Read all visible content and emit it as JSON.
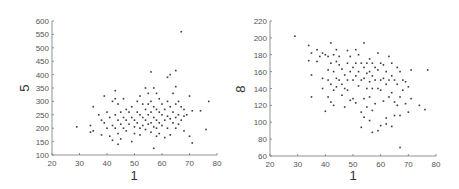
{
  "chart_data": [
    {
      "type": "scatter",
      "title": "",
      "xlabel": "1",
      "ylabel": "5",
      "xlim": [
        20,
        80
      ],
      "ylim": [
        100,
        600
      ],
      "xticks": [
        20,
        30,
        40,
        50,
        60,
        70,
        80
      ],
      "yticks": [
        100,
        150,
        200,
        250,
        300,
        350,
        400,
        450,
        500,
        550,
        600
      ],
      "grid": false,
      "legend": null,
      "points": [
        [
          29,
          205
        ],
        [
          34,
          210
        ],
        [
          34,
          185
        ],
        [
          35,
          280
        ],
        [
          35,
          190
        ],
        [
          37,
          250
        ],
        [
          38,
          230
        ],
        [
          38,
          175
        ],
        [
          39,
          320
        ],
        [
          39,
          220
        ],
        [
          40,
          200
        ],
        [
          40,
          260
        ],
        [
          41,
          170
        ],
        [
          41,
          240
        ],
        [
          42,
          300
        ],
        [
          42,
          210
        ],
        [
          42,
          155
        ],
        [
          43,
          340
        ],
        [
          43,
          310
        ],
        [
          43,
          250
        ],
        [
          43,
          200
        ],
        [
          44,
          290
        ],
        [
          44,
          230
        ],
        [
          44,
          140
        ],
        [
          44,
          180
        ],
        [
          45,
          260
        ],
        [
          45,
          215
        ],
        [
          45,
          160
        ],
        [
          46,
          310
        ],
        [
          46,
          240
        ],
        [
          46,
          200
        ],
        [
          47,
          270
        ],
        [
          47,
          230
        ],
        [
          47,
          190
        ],
        [
          48,
          260
        ],
        [
          48,
          215
        ],
        [
          49,
          280
        ],
        [
          49,
          240
        ],
        [
          49,
          150
        ],
        [
          50,
          230
        ],
        [
          50,
          205
        ],
        [
          50,
          180
        ],
        [
          51,
          300
        ],
        [
          51,
          260
        ],
        [
          51,
          220
        ],
        [
          52,
          320
        ],
        [
          52,
          250
        ],
        [
          52,
          200
        ],
        [
          52,
          175
        ],
        [
          53,
          290
        ],
        [
          53,
          240
        ],
        [
          53,
          210
        ],
        [
          54,
          350
        ],
        [
          54,
          270
        ],
        [
          54,
          230
        ],
        [
          54,
          195
        ],
        [
          55,
          330
        ],
        [
          55,
          290
        ],
        [
          55,
          250
        ],
        [
          55,
          215
        ],
        [
          56,
          410
        ],
        [
          56,
          300
        ],
        [
          56,
          260
        ],
        [
          56,
          220
        ],
        [
          56,
          185
        ],
        [
          57,
          350
        ],
        [
          57,
          280
        ],
        [
          57,
          240
        ],
        [
          57,
          205
        ],
        [
          57,
          125
        ],
        [
          58,
          330
        ],
        [
          58,
          270
        ],
        [
          58,
          230
        ],
        [
          58,
          200
        ],
        [
          58,
          170
        ],
        [
          59,
          310
        ],
        [
          59,
          260
        ],
        [
          59,
          220
        ],
        [
          59,
          180
        ],
        [
          60,
          290
        ],
        [
          60,
          250
        ],
        [
          60,
          210
        ],
        [
          61,
          270
        ],
        [
          61,
          230
        ],
        [
          61,
          165
        ],
        [
          62,
          390
        ],
        [
          62,
          300
        ],
        [
          62,
          245
        ],
        [
          62,
          200
        ],
        [
          63,
          400
        ],
        [
          63,
          280
        ],
        [
          63,
          235
        ],
        [
          63,
          175
        ],
        [
          64,
          330
        ],
        [
          64,
          260
        ],
        [
          64,
          220
        ],
        [
          65,
          415
        ],
        [
          65,
          355
        ],
        [
          65,
          290
        ],
        [
          65,
          240
        ],
        [
          65,
          200
        ],
        [
          66,
          300
        ],
        [
          66,
          250
        ],
        [
          66,
          215
        ],
        [
          67,
          560
        ],
        [
          67,
          280
        ],
        [
          67,
          230
        ],
        [
          68,
          270
        ],
        [
          68,
          245
        ],
        [
          68,
          190
        ],
        [
          69,
          250
        ],
        [
          70,
          320
        ],
        [
          70,
          170
        ],
        [
          71,
          265
        ],
        [
          71,
          145
        ],
        [
          74,
          265
        ],
        [
          76,
          195
        ],
        [
          77,
          300
        ]
      ]
    },
    {
      "type": "scatter",
      "title": "",
      "xlabel": "1",
      "ylabel": "8",
      "xlim": [
        20,
        80
      ],
      "ylim": [
        60,
        220
      ],
      "xticks": [
        20,
        30,
        40,
        50,
        60,
        70,
        80
      ],
      "yticks": [
        60,
        80,
        100,
        120,
        140,
        160,
        180,
        200,
        220
      ],
      "grid": false,
      "legend": null,
      "points": [
        [
          29,
          202
        ],
        [
          34,
          191
        ],
        [
          34,
          173
        ],
        [
          35,
          182
        ],
        [
          35,
          156
        ],
        [
          35,
          130
        ],
        [
          37,
          186
        ],
        [
          37,
          172
        ],
        [
          38,
          178
        ],
        [
          39,
          182
        ],
        [
          39,
          152
        ],
        [
          39,
          140
        ],
        [
          40,
          180
        ],
        [
          40,
          113
        ],
        [
          41,
          178
        ],
        [
          41,
          162
        ],
        [
          41,
          150
        ],
        [
          41,
          130
        ],
        [
          42,
          194
        ],
        [
          42,
          170
        ],
        [
          42,
          145
        ],
        [
          42,
          124
        ],
        [
          43,
          180
        ],
        [
          43,
          160
        ],
        [
          43,
          138
        ],
        [
          43,
          120
        ],
        [
          44,
          186
        ],
        [
          44,
          172
        ],
        [
          44,
          152
        ],
        [
          44,
          142
        ],
        [
          45,
          178
        ],
        [
          45,
          168
        ],
        [
          45,
          150
        ],
        [
          46,
          163
        ],
        [
          46,
          145
        ],
        [
          46,
          132
        ],
        [
          47,
          156
        ],
        [
          47,
          140
        ],
        [
          47,
          118
        ],
        [
          48,
          185
        ],
        [
          48,
          170
        ],
        [
          48,
          150
        ],
        [
          48,
          138
        ],
        [
          49,
          178
        ],
        [
          49,
          160
        ],
        [
          49,
          126
        ],
        [
          50,
          165
        ],
        [
          50,
          150
        ],
        [
          50,
          128
        ],
        [
          51,
          186
        ],
        [
          51,
          170
        ],
        [
          51,
          155
        ],
        [
          51,
          123
        ],
        [
          52,
          180
        ],
        [
          52,
          160
        ],
        [
          52,
          143
        ],
        [
          53,
          170
        ],
        [
          53,
          150
        ],
        [
          53,
          112
        ],
        [
          53,
          94
        ],
        [
          54,
          194
        ],
        [
          54,
          165
        ],
        [
          54,
          152
        ],
        [
          54,
          128
        ],
        [
          54,
          106
        ],
        [
          55,
          170
        ],
        [
          55,
          158
        ],
        [
          55,
          140
        ],
        [
          55,
          118
        ],
        [
          56,
          175
        ],
        [
          56,
          160
        ],
        [
          56,
          148
        ],
        [
          56,
          130
        ],
        [
          56,
          102
        ],
        [
          57,
          170
        ],
        [
          57,
          155
        ],
        [
          57,
          140
        ],
        [
          57,
          114
        ],
        [
          57,
          88
        ],
        [
          58,
          165
        ],
        [
          58,
          150
        ],
        [
          58,
          122
        ],
        [
          59,
          182
        ],
        [
          59,
          162
        ],
        [
          59,
          140
        ],
        [
          59,
          90
        ],
        [
          60,
          170
        ],
        [
          60,
          150
        ],
        [
          60,
          138
        ],
        [
          60,
          96
        ],
        [
          61,
          168
        ],
        [
          61,
          152
        ],
        [
          61,
          125
        ],
        [
          62,
          160
        ],
        [
          62,
          145
        ],
        [
          62,
          105
        ],
        [
          62,
          98
        ],
        [
          63,
          178
        ],
        [
          63,
          150
        ],
        [
          63,
          130
        ],
        [
          64,
          170
        ],
        [
          64,
          155
        ],
        [
          64,
          135
        ],
        [
          64,
          95
        ],
        [
          65,
          150
        ],
        [
          65,
          124
        ],
        [
          65,
          108
        ],
        [
          66,
          165
        ],
        [
          66,
          145
        ],
        [
          66,
          120
        ],
        [
          67,
          160
        ],
        [
          67,
          130
        ],
        [
          67,
          108
        ],
        [
          67,
          70
        ],
        [
          68,
          150
        ],
        [
          68,
          138
        ],
        [
          69,
          148
        ],
        [
          69,
          122
        ],
        [
          70,
          142
        ],
        [
          70,
          112
        ],
        [
          71,
          162
        ],
        [
          71,
          128
        ],
        [
          74,
          120
        ],
        [
          76,
          115
        ],
        [
          77,
          162
        ]
      ]
    }
  ],
  "charts": [
    {
      "xlabel": "1",
      "ylabel": "5"
    },
    {
      "xlabel": "1",
      "ylabel": "8"
    }
  ]
}
